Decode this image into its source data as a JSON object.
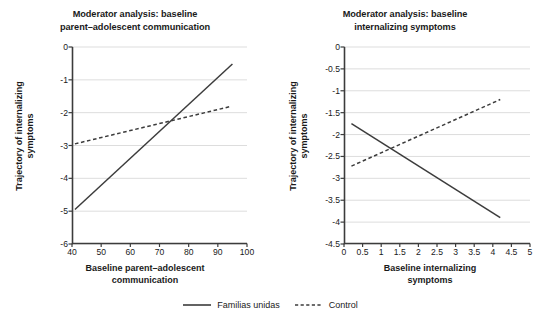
{
  "figure": {
    "legend": {
      "entries": [
        {
          "label": "Familias unidas",
          "style": "solid",
          "color": "#3c3c3c"
        },
        {
          "label": "Control",
          "style": "dashed",
          "color": "#3c3c3c"
        }
      ]
    }
  },
  "panel_a": {
    "title_line1": "Moderator analysis: baseline",
    "title_line2": "parent–adolescent communication",
    "ylabel_line1": "Trajectory of internalizing",
    "ylabel_line2": "symptoms",
    "xlabel_line1": "Baseline parent–adolescent",
    "xlabel_line2": "communication",
    "yticks": [
      "0",
      "-1",
      "-2",
      "-3",
      "-4",
      "-5",
      "-6"
    ],
    "xticks": [
      "40",
      "50",
      "60",
      "70",
      "80",
      "90",
      "100"
    ]
  },
  "panel_b": {
    "title_line1": "Moderator analysis: baseline",
    "title_line2": "internalizing symptoms",
    "ylabel_line1": "Trajectory of internalizing",
    "ylabel_line2": "symptoms",
    "xlabel_line1": "Baseline internalizing",
    "xlabel_line2": "symptoms",
    "yticks": [
      "0",
      "-0.5",
      "-1",
      "-1.5",
      "-2",
      "-2.5",
      "-3",
      "-3.5",
      "-4",
      "-4.5"
    ],
    "xticks": [
      "0",
      "0.5",
      "1",
      "1.5",
      "2",
      "2.5",
      "3",
      "3.5",
      "4",
      "4.5",
      "5"
    ]
  },
  "chart_data": [
    {
      "type": "line",
      "title": "Moderator analysis: baseline parent–adolescent communication",
      "xlabel": "Baseline parent–adolescent communication",
      "ylabel": "Trajectory of internalizing symptoms",
      "xlim": [
        40,
        100
      ],
      "ylim": [
        -6,
        0
      ],
      "xticks": [
        40,
        50,
        60,
        70,
        80,
        90,
        100
      ],
      "yticks": [
        0,
        -1,
        -2,
        -3,
        -4,
        -5,
        -6
      ],
      "grid": "horizontal",
      "legend_position": "bottom-center-shared",
      "series": [
        {
          "name": "Familias unidas",
          "style": "solid",
          "color": "#3c3c3c",
          "x": [
            41,
            95
          ],
          "y": [
            -4.95,
            -0.52
          ]
        },
        {
          "name": "Control",
          "style": "dashed",
          "color": "#3c3c3c",
          "x": [
            41,
            94
          ],
          "y": [
            -2.95,
            -1.82
          ]
        }
      ]
    },
    {
      "type": "line",
      "title": "Moderator analysis: baseline internalizing symptoms",
      "xlabel": "Baseline internalizing symptoms",
      "ylabel": "Trajectory of internalizing symptoms",
      "xlim": [
        0,
        5
      ],
      "ylim": [
        -4.5,
        0
      ],
      "xticks": [
        0,
        0.5,
        1,
        1.5,
        2,
        2.5,
        3,
        3.5,
        4,
        4.5,
        5
      ],
      "yticks": [
        0,
        -0.5,
        -1,
        -1.5,
        -2,
        -2.5,
        -3,
        -3.5,
        -4,
        -4.5
      ],
      "grid": "horizontal",
      "legend_position": "bottom-center-shared",
      "series": [
        {
          "name": "Familias unidas",
          "style": "solid",
          "color": "#3c3c3c",
          "x": [
            0.2,
            4.2
          ],
          "y": [
            -1.75,
            -3.9
          ]
        },
        {
          "name": "Control",
          "style": "dashed",
          "color": "#3c3c3c",
          "x": [
            0.2,
            4.2
          ],
          "y": [
            -2.72,
            -1.2
          ]
        }
      ]
    }
  ]
}
